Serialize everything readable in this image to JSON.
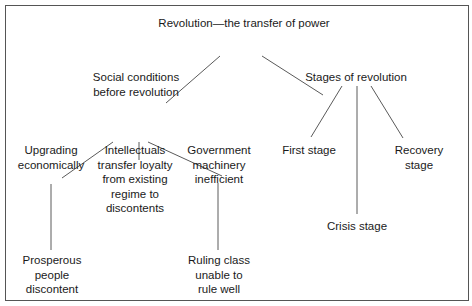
{
  "diagram": {
    "root": {
      "label": "Revolution—the transfer of power"
    },
    "branches": [
      {
        "label": "Social conditions\nbefore revolution",
        "children": [
          {
            "label": "Upgrading\neconomically",
            "child": {
              "label": "Prosperous\npeople\ndiscontent"
            }
          },
          {
            "label": "Intellectuals\ntransfer loyalty\nfrom existing\nregime to\ndiscontents"
          },
          {
            "label": "Government\nmachinery\ninefficient",
            "child": {
              "label": "Ruling class\nunable to\nrule well"
            }
          }
        ]
      },
      {
        "label": "Stages of revolution",
        "children": [
          {
            "label": "First stage"
          },
          {
            "label": "Crisis stage"
          },
          {
            "label": "Recovery stage"
          }
        ]
      }
    ]
  },
  "colors": {
    "line": "#5a5a5a",
    "border": "#555555",
    "text": "#1a1a1a"
  }
}
